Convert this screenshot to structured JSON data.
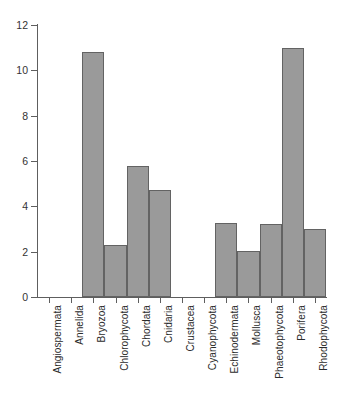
{
  "chart_data": {
    "type": "bar",
    "title": "",
    "subtitle": "",
    "xlabel": "",
    "ylabel": "",
    "xlim_categories": 13,
    "ylim": [
      0,
      12
    ],
    "y_ticks": [
      0,
      2,
      4,
      6,
      8,
      10,
      12
    ],
    "grid": false,
    "legend": null,
    "bar_style": "contiguous-histogram",
    "colors": {
      "bar_fill": "#9a9a9a",
      "bar_edge": "#636363",
      "axis": "#5e5e5e",
      "text": "#2b2b2b",
      "background": "#ffffff"
    },
    "categories": [
      "Angiospermata",
      "Annelida",
      "Bryozoa",
      "Chlorophycota",
      "Chordata",
      "Cnidaria",
      "Crustacea",
      "Cyanophycota",
      "Echinodermata",
      "Mollusca",
      "Phaeotophycota",
      "Porifera",
      "Rhodophycota"
    ],
    "values": [
      0,
      0,
      10.8,
      2.3,
      5.8,
      4.7,
      0,
      0,
      3.25,
      2.05,
      3.2,
      11.0,
      3.0
    ]
  }
}
